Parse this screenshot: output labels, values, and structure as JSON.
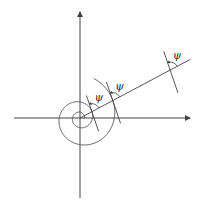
{
  "diagram": {
    "angle_label": "ψ",
    "stroke_color": "#555555",
    "tangent_points": 3,
    "spiral_growth_per_turn": 2.75
  }
}
